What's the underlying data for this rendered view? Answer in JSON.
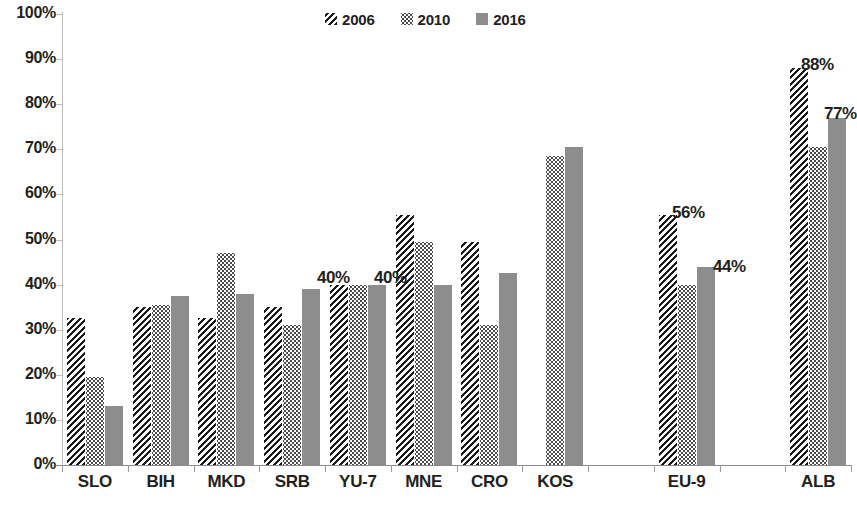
{
  "chart_data": {
    "type": "bar",
    "title": "",
    "subtitle": "",
    "xlabel": "",
    "ylabel": "",
    "ylim": [
      0,
      100
    ],
    "ytick_labels": [
      "100%",
      "90%",
      "80%",
      "70%",
      "60%",
      "50%",
      "40%",
      "30%",
      "20%",
      "10%",
      "0%"
    ],
    "ytick_values": [
      100,
      90,
      80,
      70,
      60,
      50,
      40,
      30,
      20,
      10,
      0
    ],
    "grid": false,
    "legend_position": "top-center",
    "legend": [
      "2006",
      "2010",
      "2016"
    ],
    "categories": [
      "SLO",
      "BIH",
      "MKD",
      "SRB",
      "YU-7",
      "MNE",
      "CRO",
      "KOS",
      "",
      "EU-9",
      "",
      "ALB"
    ],
    "series": [
      {
        "name": "2006",
        "pattern": "diagonal-hatch",
        "color": "#1a1a1a",
        "values": [
          32.5,
          35.0,
          32.5,
          35.0,
          40.0,
          55.5,
          49.5,
          null,
          null,
          55.5,
          null,
          88.0
        ]
      },
      {
        "name": "2010",
        "pattern": "dotted",
        "color": "#4a4a4a",
        "values": [
          19.5,
          35.5,
          47.0,
          31.0,
          40.0,
          49.5,
          31.0,
          68.5,
          null,
          40.0,
          null,
          70.5
        ]
      },
      {
        "name": "2016",
        "pattern": "solid-gray",
        "color": "#8d8d8d",
        "values": [
          13.0,
          37.5,
          38.0,
          39.0,
          40.0,
          40.0,
          42.5,
          70.5,
          null,
          44.0,
          null,
          77.0
        ]
      }
    ],
    "annotations": [
      {
        "text": "40%",
        "category": "SRB",
        "x_px": 317,
        "y_px": 268
      },
      {
        "text": "40%",
        "category": "YU-7",
        "x_px": 374,
        "y_px": 268
      },
      {
        "text": "56%",
        "category": "EU-9",
        "x_px": 672,
        "y_px": 203
      },
      {
        "text": "44%",
        "category": "EU-9",
        "x_px": 713,
        "y_px": 257
      },
      {
        "text": "88%",
        "category": "ALB",
        "x_px": 801,
        "y_px": 55
      },
      {
        "text": "77%",
        "category": "ALB",
        "x_px": 824,
        "y_px": 104
      }
    ]
  },
  "axis": {
    "y_ticks": [
      {
        "label": "100%",
        "value": 100
      },
      {
        "label": "90%",
        "value": 90
      },
      {
        "label": "80%",
        "value": 80
      },
      {
        "label": "70%",
        "value": 70
      },
      {
        "label": "60%",
        "value": 60
      },
      {
        "label": "50%",
        "value": 50
      },
      {
        "label": "40%",
        "value": 40
      },
      {
        "label": "30%",
        "value": 30
      },
      {
        "label": "20%",
        "value": 20
      },
      {
        "label": "10%",
        "value": 10
      },
      {
        "label": "0%",
        "value": 0
      }
    ]
  },
  "colors": {
    "series_2006": "#1a1a1a",
    "series_2010": "#4a4a4a",
    "series_2016": "#8d8d8d",
    "axis": "#8a8a8a",
    "text": "#231f20",
    "background": "#ffffff"
  }
}
